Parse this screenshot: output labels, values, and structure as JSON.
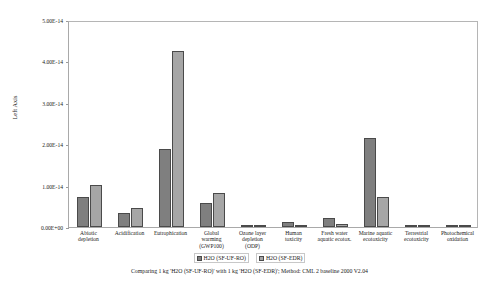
{
  "chart_data": {
    "type": "bar",
    "title": "",
    "subtitle": "",
    "xlabel": "",
    "ylabel": "Left Axis",
    "ylim": [
      0,
      5e-14
    ],
    "grid": false,
    "legend_position": "bottom",
    "ytick_labels": [
      "0.00E+00",
      "1.00E-14",
      "2.00E-14",
      "3.00E-14",
      "4.00E-14",
      "5.00E-14"
    ],
    "ytick_values": [
      0,
      1e-14,
      2e-14,
      3e-14,
      4e-14,
      5e-14
    ],
    "categories": [
      "Abiotic\ndepletion",
      "Acidification",
      "Eutrophication",
      "Global\nwarming\n(GWP100)",
      "Ozone layer\ndepletion\n(ODP)",
      "Human\ntoxicity",
      "Fresh water\naquatic ecotox.",
      "Marine aquatic\necotoxicity",
      "Terrestrial\necotoxicity",
      "Photochemical\noxidation"
    ],
    "series": [
      {
        "name": "H2O (SF-UF-RO)",
        "color": "#7f7f7f",
        "values": [
          7.2e-15,
          3.3e-15,
          1.88e-14,
          5.8e-15,
          2e-17,
          1.2e-15,
          2.2e-15,
          2.15e-14,
          2.5e-16,
          2.5e-16
        ]
      },
      {
        "name": "H2O (SF-EDR)",
        "color": "#a6a6a6",
        "values": [
          1.02e-14,
          4.7e-15,
          4.25e-14,
          8.3e-15,
          3e-17,
          3e-16,
          8e-16,
          7.2e-15,
          4.5e-16,
          4e-16
        ]
      }
    ],
    "annotations": {
      "footer": "Comparing 1 kg 'H2O (SF-UF-RO)' with 1 kg 'H2O (SF-EDR)';  Method: CML 2 baseline 2000 V2.04"
    }
  }
}
